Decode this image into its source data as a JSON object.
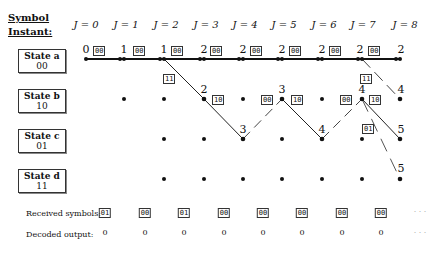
{
  "header": {
    "title_line1": "Symbol",
    "title_line2": "Instant:"
  },
  "instants": [
    "J = 0",
    "J = 1",
    "J = 2",
    "J = 3",
    "J = 4",
    "J = 5",
    "J = 6",
    "J = 7",
    "J = 8"
  ],
  "instant_x": [
    86,
    124,
    164,
    204,
    243,
    282,
    322,
    362,
    400
  ],
  "states": [
    {
      "name": "State a",
      "code": "00",
      "y": 59
    },
    {
      "name": "State b",
      "code": "10",
      "y": 99
    },
    {
      "name": "State c",
      "code": "01",
      "y": 139
    },
    {
      "name": "State d",
      "code": "11",
      "y": 179
    }
  ],
  "state_a_metrics": [
    "0",
    "1",
    "1",
    "2",
    "2",
    "2",
    "2",
    "2",
    "2"
  ],
  "state_a_branch_labels": [
    "00",
    "00",
    "00",
    "00",
    "00",
    "00",
    "00",
    "00"
  ],
  "other_metrics": {
    "b_j3": "2",
    "c_j4": "3",
    "b_j5": "3",
    "c_j6": "4",
    "b_j7": "4",
    "b_j8": "4",
    "c_j8": "5",
    "d_j8": "5"
  },
  "branch_labels": {
    "a2_b3": "11",
    "b3_c4": "10",
    "c4_b5": "00",
    "b5_c6": "10",
    "c6_b7": "00",
    "b7_c8": "10",
    "a7_b8": "11",
    "b7_d8": "01"
  },
  "received": {
    "label": "Received symbols:",
    "values": [
      "01",
      "00",
      "01",
      "00",
      "00",
      "00",
      "00",
      "00"
    ],
    "more": "· · ·"
  },
  "decoded": {
    "label": "Decoded output:",
    "values": [
      "0",
      "0",
      "0",
      "0",
      "0",
      "0",
      "0",
      "0"
    ],
    "more": "· · ·"
  }
}
